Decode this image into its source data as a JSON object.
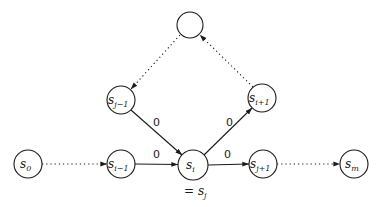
{
  "diagram": {
    "type": "state-transition-graph",
    "nodes": [
      {
        "id": "s0",
        "base": "s",
        "sub": "0",
        "cx": 28,
        "cy": 164
      },
      {
        "id": "s_i-1",
        "base": "s",
        "sub": "i−1",
        "cx": 121,
        "cy": 164
      },
      {
        "id": "s_i",
        "base": "s",
        "sub": "i",
        "cx": 193,
        "cy": 165
      },
      {
        "id": "s_j+1",
        "base": "s",
        "sub": "j+1",
        "cx": 263,
        "cy": 164
      },
      {
        "id": "s_m",
        "base": "s",
        "sub": "m",
        "cx": 354,
        "cy": 164
      },
      {
        "id": "s_j-1",
        "base": "s",
        "sub": "j−1",
        "cx": 121,
        "cy": 100
      },
      {
        "id": "s_i+1",
        "base": "s",
        "sub": "i+1",
        "cx": 262,
        "cy": 98
      },
      {
        "id": "top",
        "base": "",
        "sub": "",
        "cx": 190,
        "cy": 25
      }
    ],
    "edges": [
      {
        "from": "s0",
        "to": "s_i-1",
        "style": "dotted",
        "label": ""
      },
      {
        "from": "s_i-1",
        "to": "s_i",
        "style": "solid",
        "label": "0"
      },
      {
        "from": "s_i",
        "to": "s_j+1",
        "style": "solid",
        "label": "0"
      },
      {
        "from": "s_j+1",
        "to": "s_m",
        "style": "dotted",
        "label": ""
      },
      {
        "from": "s_j-1",
        "to": "s_i",
        "style": "solid",
        "label": "0"
      },
      {
        "from": "s_i",
        "to": "s_i+1",
        "style": "solid",
        "label": "0"
      },
      {
        "from": "s_i+1",
        "to": "top",
        "style": "dotted",
        "label": ""
      },
      {
        "from": "top",
        "to": "s_j-1",
        "style": "dotted",
        "label": ""
      }
    ],
    "annotation": {
      "prefix": "= ",
      "base": "s",
      "sub": "j"
    },
    "node_radius": 14
  }
}
